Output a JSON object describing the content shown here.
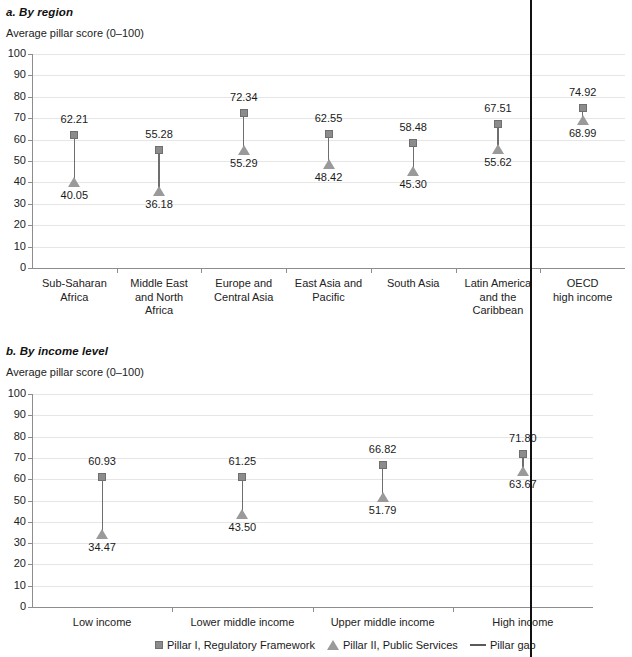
{
  "panels": [
    {
      "id": "by-region",
      "title": "a. By region",
      "subtitle": "Average pillar score (0–100)"
    },
    {
      "id": "by-income-level",
      "title": "b. By income level",
      "subtitle": "Average pillar score (0–100)"
    }
  ],
  "legend": {
    "items": [
      {
        "marker": "square-marker",
        "label": "Pillar I, Regulatory Framework"
      },
      {
        "marker": "triangle-marker",
        "label": "Pillar II, Public Services"
      },
      {
        "marker": "line-marker",
        "label": "Pillar gap"
      }
    ]
  },
  "colors": {
    "marker_fill": "#8c8c8c",
    "marker_stroke": "#6f6f6f",
    "triangle_fill": "#9a9a9a",
    "stem": "#6e6e6e",
    "gridline": "#e6e6e6",
    "axis": "#8d8d8d",
    "text": "#1a1a1a",
    "divider": "#111111"
  },
  "yticks": [
    "100",
    "90",
    "80",
    "70",
    "60",
    "50",
    "40",
    "30",
    "20",
    "10",
    "0"
  ],
  "chart_data": [
    {
      "type": "scatter",
      "id": "by-region",
      "title": "a. By region",
      "ylabel": "Average pillar score (0–100)",
      "xlabel": "",
      "ylim": [
        0,
        100
      ],
      "yticks": [
        0,
        10,
        20,
        30,
        40,
        50,
        60,
        70,
        80,
        90,
        100
      ],
      "grid": true,
      "legend_position": "bottom",
      "categories": [
        "Sub-Saharan Africa",
        "Middle East and North Africa",
        "Europe and Central Asia",
        "East Asia and Pacific",
        "South Asia",
        "Latin America and the Caribbean",
        "OECD high income"
      ],
      "category_lines": [
        [
          "Sub-Saharan",
          "Africa"
        ],
        [
          "Middle East",
          "and North",
          "Africa"
        ],
        [
          "Europe and",
          "Central Asia"
        ],
        [
          "East Asia and",
          "Pacific"
        ],
        [
          "South Asia"
        ],
        [
          "Latin America",
          "and the",
          "Caribbean"
        ],
        [
          "OECD",
          "high income"
        ]
      ],
      "series": [
        {
          "name": "Pillar I, Regulatory Framework",
          "marker": "square",
          "values": [
            62.21,
            55.28,
            72.34,
            62.55,
            58.48,
            67.51,
            74.92
          ]
        },
        {
          "name": "Pillar II, Public Services",
          "marker": "triangle",
          "values": [
            40.05,
            36.18,
            55.29,
            48.42,
            45.3,
            55.62,
            68.99
          ]
        }
      ]
    },
    {
      "type": "scatter",
      "id": "by-income-level",
      "title": "b. By income level",
      "ylabel": "Average pillar score (0–100)",
      "xlabel": "",
      "ylim": [
        0,
        100
      ],
      "yticks": [
        0,
        10,
        20,
        30,
        40,
        50,
        60,
        70,
        80,
        90,
        100
      ],
      "grid": true,
      "legend_position": "bottom",
      "categories": [
        "Low income",
        "Lower middle income",
        "Upper middle income",
        "High income"
      ],
      "category_lines": [
        [
          "Low income"
        ],
        [
          "Lower middle income"
        ],
        [
          "Upper middle income"
        ],
        [
          "High income"
        ]
      ],
      "series": [
        {
          "name": "Pillar I, Regulatory Framework",
          "marker": "square",
          "values": [
            60.93,
            61.25,
            66.82,
            71.8
          ]
        },
        {
          "name": "Pillar II, Public Services",
          "marker": "triangle",
          "values": [
            34.47,
            43.5,
            51.79,
            63.67
          ]
        }
      ]
    }
  ]
}
